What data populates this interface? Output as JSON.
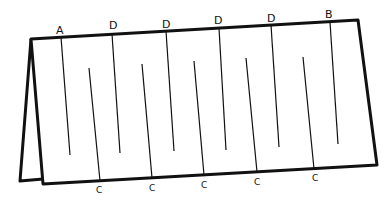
{
  "diagram": {
    "top_labels": [
      "A",
      "D",
      "D",
      "D",
      "D",
      "B"
    ],
    "bottom_labels": [
      "C",
      "C",
      "C",
      "C",
      "C"
    ],
    "colors": {
      "ink": "#111111",
      "paper": "#ffffff"
    }
  }
}
